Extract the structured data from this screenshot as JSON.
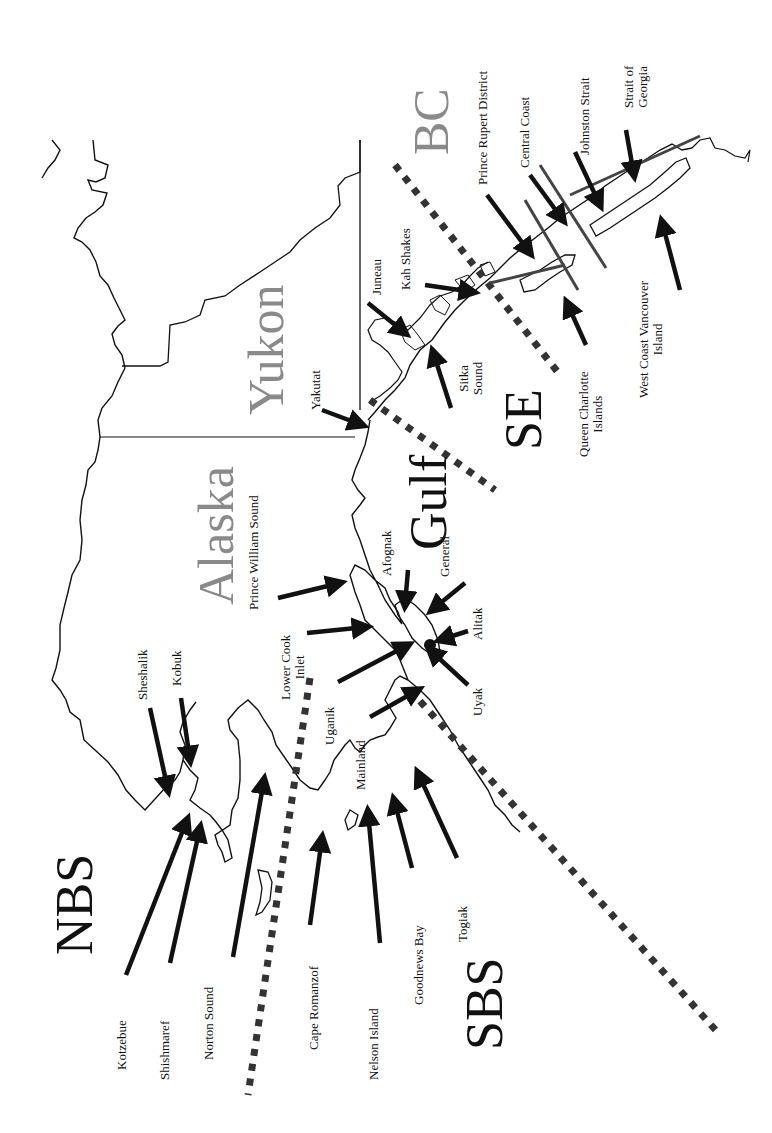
{
  "map": {
    "type": "regional-map",
    "orientation": "rotated 90 degrees counter-clockwise (north to the left)",
    "colors": {
      "coastline": "#111111",
      "arrows": "#111111",
      "boundary_dots": "#333333",
      "region_labels": "#8a8a8a",
      "zone_labels": "#111111",
      "bc_lines": "#444444"
    },
    "regions": {
      "alaska": "Alaska",
      "yukon": "Yukon",
      "bc": "BC"
    },
    "zones": {
      "nbs": "NBS",
      "sbs": "SBS",
      "gulf": "Gulf",
      "se": "SE"
    },
    "sites": {
      "kotzebue": "Kotzebue",
      "shishmaref": "Shishmaref",
      "norton_sound": "Norton Sound",
      "cape_romanzof": "Cape Romanzof",
      "nelson_island": "Nelson Island",
      "goodnews_bay": "Goodnews Bay",
      "togiak": "Togiak",
      "sheshalik": "Sheshalik",
      "kobuk": "Kobuk",
      "uganik": "Uganik",
      "mainland": "Mainland",
      "lower_cook_inlet_1": "Lower Cook",
      "lower_cook_inlet_2": "Inlet",
      "prince_william_sound": "Prince William Sound",
      "afognak": "Afognak",
      "general": "General",
      "alitak": "Alitak",
      "uyak": "Uyak",
      "yakutat": "Yakutat",
      "juneau": "Juneau",
      "kah_shakes": "Kah Shakes",
      "sitka_sound_1": "Sitka",
      "sitka_sound_2": "Sound",
      "queen_charlotte_1": "Queen Charlotte",
      "queen_charlotte_2": "Islands",
      "prince_rupert": "Prince Rupert District",
      "central_coast": "Central Coast",
      "johnston_strait": "Johnston Strait",
      "strait_georgia_1": "Strait of",
      "strait_georgia_2": "Georgia",
      "west_coast_vi_1": "West Coast Vancouver",
      "west_coast_vi_2": "Island"
    }
  }
}
